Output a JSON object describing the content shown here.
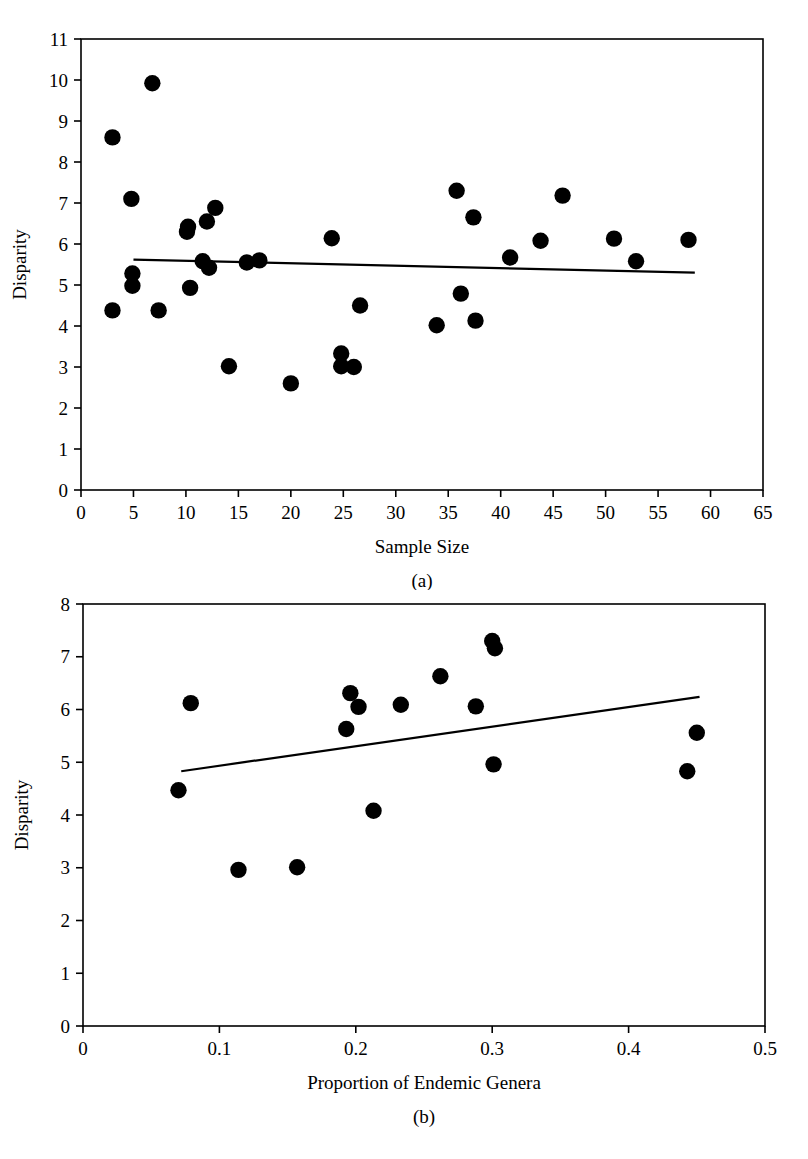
{
  "figure": {
    "background_color": "#ffffff",
    "ink_color": "#000000"
  },
  "panel_a": {
    "caption": "(a)",
    "xlabel": "Sample Size",
    "ylabel": "Disparity"
  },
  "panel_b": {
    "caption": "(b)",
    "xlabel": "Proportion of Endemic Genera",
    "ylabel": "Disparity"
  },
  "chart_data": [
    {
      "id": "panel-a",
      "type": "scatter",
      "title": "",
      "caption": "(a)",
      "xlabel": "Sample Size",
      "ylabel": "Disparity",
      "xlim": [
        0,
        65
      ],
      "ylim": [
        0,
        11
      ],
      "xticks": [
        0,
        5,
        10,
        15,
        20,
        25,
        30,
        35,
        40,
        45,
        50,
        55,
        60,
        65
      ],
      "xtick_labels": [
        "0",
        "5",
        "10",
        "15",
        "20",
        "25",
        "30",
        "35",
        "40",
        "45",
        "50",
        "55",
        "60",
        "65"
      ],
      "yticks": [
        0,
        1,
        2,
        3,
        4,
        5,
        6,
        7,
        8,
        9,
        10,
        11
      ],
      "ytick_labels": [
        "0",
        "1",
        "2",
        "3",
        "4",
        "5",
        "6",
        "7",
        "8",
        "9",
        "10",
        "11"
      ],
      "grid": false,
      "legend": "none",
      "marker": "filled-circle",
      "marker_color": "#000000",
      "points": [
        {
          "x": 3.0,
          "y": 8.6
        },
        {
          "x": 3.0,
          "y": 4.38
        },
        {
          "x": 4.8,
          "y": 7.1
        },
        {
          "x": 4.9,
          "y": 5.28
        },
        {
          "x": 4.9,
          "y": 4.98
        },
        {
          "x": 6.8,
          "y": 9.92
        },
        {
          "x": 7.4,
          "y": 4.38
        },
        {
          "x": 10.1,
          "y": 6.3
        },
        {
          "x": 10.2,
          "y": 6.42
        },
        {
          "x": 10.4,
          "y": 4.93
        },
        {
          "x": 11.6,
          "y": 5.58
        },
        {
          "x": 12.0,
          "y": 6.55
        },
        {
          "x": 12.2,
          "y": 5.42
        },
        {
          "x": 12.8,
          "y": 6.88
        },
        {
          "x": 14.1,
          "y": 3.02
        },
        {
          "x": 15.8,
          "y": 5.55
        },
        {
          "x": 17.0,
          "y": 5.6
        },
        {
          "x": 20.0,
          "y": 2.6
        },
        {
          "x": 23.9,
          "y": 6.14
        },
        {
          "x": 24.8,
          "y": 3.33
        },
        {
          "x": 24.8,
          "y": 3.02
        },
        {
          "x": 26.0,
          "y": 3.0
        },
        {
          "x": 26.6,
          "y": 4.5
        },
        {
          "x": 33.9,
          "y": 4.02
        },
        {
          "x": 35.8,
          "y": 7.3
        },
        {
          "x": 36.2,
          "y": 4.79
        },
        {
          "x": 37.4,
          "y": 6.65
        },
        {
          "x": 37.6,
          "y": 4.13
        },
        {
          "x": 40.9,
          "y": 5.67
        },
        {
          "x": 43.8,
          "y": 6.08
        },
        {
          "x": 45.9,
          "y": 7.18
        },
        {
          "x": 50.8,
          "y": 6.13
        },
        {
          "x": 52.9,
          "y": 5.58
        },
        {
          "x": 57.9,
          "y": 6.1
        }
      ],
      "fit_line": {
        "x_start": 5.0,
        "y_start": 5.62,
        "x_end": 58.5,
        "y_end": 5.3,
        "style": "solid"
      }
    },
    {
      "id": "panel-b",
      "type": "scatter",
      "title": "",
      "caption": "(b)",
      "xlabel": "Proportion of Endemic Genera",
      "ylabel": "Disparity",
      "xlim": [
        0,
        0.5
      ],
      "ylim": [
        0,
        8
      ],
      "xticks": [
        0,
        0.1,
        0.2,
        0.3,
        0.4,
        0.5
      ],
      "xtick_labels": [
        "0",
        "0.1",
        "0.2",
        "0.3",
        "0.4",
        "0.5"
      ],
      "yticks": [
        0,
        1,
        2,
        3,
        4,
        5,
        6,
        7,
        8
      ],
      "ytick_labels": [
        "0",
        "1",
        "2",
        "3",
        "4",
        "5",
        "6",
        "7",
        "8"
      ],
      "grid": false,
      "legend": "none",
      "marker": "filled-circle",
      "marker_color": "#000000",
      "points": [
        {
          "x": 0.07,
          "y": 4.47
        },
        {
          "x": 0.079,
          "y": 6.12
        },
        {
          "x": 0.114,
          "y": 2.96
        },
        {
          "x": 0.157,
          "y": 3.01
        },
        {
          "x": 0.193,
          "y": 5.63
        },
        {
          "x": 0.196,
          "y": 6.31
        },
        {
          "x": 0.202,
          "y": 6.05
        },
        {
          "x": 0.213,
          "y": 4.08
        },
        {
          "x": 0.233,
          "y": 6.09
        },
        {
          "x": 0.262,
          "y": 6.63
        },
        {
          "x": 0.288,
          "y": 6.06
        },
        {
          "x": 0.3,
          "y": 7.3
        },
        {
          "x": 0.302,
          "y": 7.16
        },
        {
          "x": 0.301,
          "y": 4.96
        },
        {
          "x": 0.443,
          "y": 4.83
        },
        {
          "x": 0.45,
          "y": 5.56
        }
      ],
      "fit_line": {
        "x_start": 0.072,
        "y_start": 4.83,
        "x_end": 0.452,
        "y_end": 6.24,
        "style": "solid"
      }
    }
  ]
}
